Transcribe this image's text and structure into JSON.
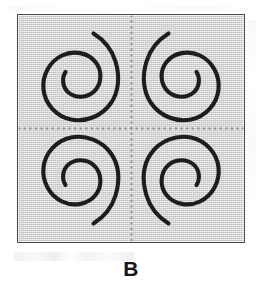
{
  "figure": {
    "caption": "B",
    "panel": {
      "fill_color": "#d2d2d2",
      "border_color": "#4a4a4a",
      "divider_color": "#8e8e8e",
      "stroke_color": "#1d1d1d"
    },
    "quadrants": [
      {
        "id": "top-left",
        "name": "spiral-top-left",
        "chirality": "counterclockwise-inward",
        "tail_direction": "up-right",
        "inner_tip_direction": "left"
      },
      {
        "id": "top-right",
        "name": "spiral-top-right",
        "chirality": "clockwise-inward",
        "tail_direction": "up-left",
        "inner_tip_direction": "right"
      },
      {
        "id": "bottom-left",
        "name": "spiral-bottom-left",
        "chirality": "clockwise-inward",
        "tail_direction": "down-right",
        "inner_tip_direction": "left"
      },
      {
        "id": "bottom-right",
        "name": "spiral-bottom-right",
        "chirality": "counterclockwise-inward",
        "tail_direction": "down-left",
        "inner_tip_direction": "right"
      }
    ],
    "dividers": [
      {
        "name": "vertical-divider",
        "orientation": "vertical",
        "style": "dotted"
      },
      {
        "name": "horizontal-divider",
        "orientation": "horizontal",
        "style": "dotted"
      }
    ]
  }
}
